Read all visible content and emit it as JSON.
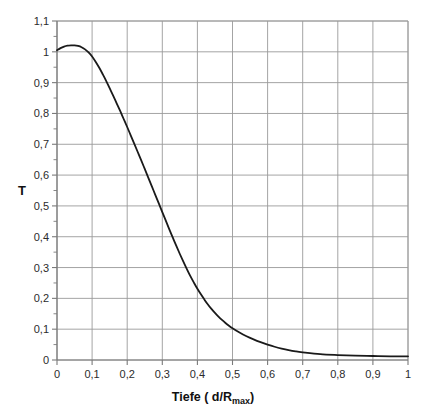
{
  "chart_data": {
    "type": "line",
    "title": "",
    "subtitle": "",
    "xlabel_parts": {
      "main": "Tiefe ( d/R",
      "sub": "max",
      "tail": ")"
    },
    "xlabel": "Tiefe ( d/Rmax)",
    "ylabel": "T",
    "xlim": [
      0,
      1
    ],
    "ylim": [
      0,
      1.1
    ],
    "grid": true,
    "legend": null,
    "x_major_step": 0.1,
    "y_major_step": 0.1,
    "y_minor_step": 0.05,
    "x_tick_labels": [
      "0",
      "0,1",
      "0,2",
      "0,3",
      "0,4",
      "0,5",
      "0,6",
      "0,7",
      "0,8",
      "0,9",
      "1"
    ],
    "x_tick_values": [
      0,
      0.1,
      0.2,
      0.3,
      0.4,
      0.5,
      0.6,
      0.7,
      0.8,
      0.9,
      1
    ],
    "y_tick_labels": [
      "0",
      "0,1",
      "0,2",
      "0,3",
      "0,4",
      "0,5",
      "0,6",
      "0,7",
      "0,8",
      "0,9",
      "1",
      "1,1"
    ],
    "y_tick_values": [
      0,
      0.1,
      0.2,
      0.3,
      0.4,
      0.5,
      0.6,
      0.7,
      0.8,
      0.9,
      1,
      1.1
    ],
    "series": [
      {
        "name": "T",
        "color": "#1a1a1a",
        "line_width": 1.8,
        "x": [
          0.0,
          0.01,
          0.02,
          0.03,
          0.04,
          0.05,
          0.06,
          0.07,
          0.08,
          0.09,
          0.1,
          0.11,
          0.12,
          0.13,
          0.14,
          0.15,
          0.16,
          0.17,
          0.18,
          0.19,
          0.2,
          0.21,
          0.22,
          0.23,
          0.24,
          0.25,
          0.26,
          0.27,
          0.28,
          0.29,
          0.3,
          0.31,
          0.32,
          0.33,
          0.34,
          0.35,
          0.36,
          0.37,
          0.38,
          0.39,
          0.4,
          0.41,
          0.42,
          0.43,
          0.44,
          0.45,
          0.46,
          0.47,
          0.48,
          0.49,
          0.5,
          0.52,
          0.54,
          0.56,
          0.58,
          0.6,
          0.62,
          0.64,
          0.66,
          0.68,
          0.7,
          0.75,
          0.8,
          0.85,
          0.9,
          0.95,
          1.0
        ],
        "y": [
          1.005,
          1.012,
          1.017,
          1.02,
          1.021,
          1.021,
          1.019,
          1.015,
          1.008,
          0.998,
          0.985,
          0.968,
          0.949,
          0.928,
          0.906,
          0.882,
          0.858,
          0.833,
          0.808,
          0.782,
          0.756,
          0.729,
          0.702,
          0.675,
          0.648,
          0.62,
          0.592,
          0.564,
          0.536,
          0.508,
          0.48,
          0.452,
          0.424,
          0.397,
          0.37,
          0.344,
          0.319,
          0.295,
          0.272,
          0.251,
          0.231,
          0.213,
          0.196,
          0.18,
          0.166,
          0.153,
          0.141,
          0.13,
          0.12,
          0.111,
          0.103,
          0.089,
          0.077,
          0.067,
          0.058,
          0.05,
          0.043,
          0.037,
          0.032,
          0.028,
          0.025,
          0.019,
          0.016,
          0.014,
          0.013,
          0.012,
          0.012
        ]
      }
    ],
    "annotations": []
  },
  "plot_geometry": {
    "left": 57,
    "right": 408,
    "top": 21,
    "bottom": 360
  },
  "style": {
    "background": "#ffffff",
    "curve_color": "#1a1a1a",
    "grid_color": "#9a9a9a",
    "minor_grid_color": "#d0d0d0",
    "axis_color": "#7a7a7a",
    "text_color": "#2b2b2b"
  }
}
